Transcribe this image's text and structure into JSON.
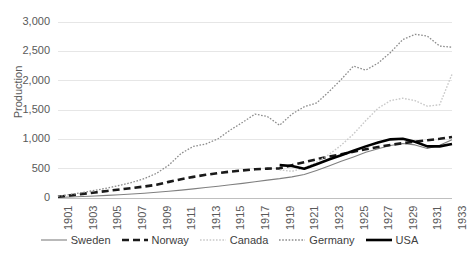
{
  "chart_data": {
    "type": "line",
    "title": "",
    "xlabel": "",
    "ylabel": "Production",
    "ylim": [
      0,
      3000
    ],
    "ytick_values": [
      0,
      500,
      1000,
      1500,
      2000,
      2500,
      3000
    ],
    "ytick_labels": [
      "0",
      "500",
      "1,000",
      "1,500",
      "2,000",
      "2,500",
      "3,000"
    ],
    "grid": true,
    "legend_position": "bottom",
    "x": [
      1901,
      1902,
      1903,
      1904,
      1905,
      1906,
      1907,
      1908,
      1909,
      1910,
      1911,
      1912,
      1913,
      1914,
      1915,
      1916,
      1917,
      1918,
      1919,
      1920,
      1921,
      1922,
      1923,
      1924,
      1925,
      1926,
      1927,
      1928,
      1929,
      1930,
      1931,
      1932,
      1933
    ],
    "xtick_labels": [
      "1901",
      "1903",
      "1905",
      "1907",
      "1909",
      "1911",
      "1913",
      "1915",
      "1917",
      "1919",
      "1921",
      "1923",
      "1925",
      "1927",
      "1929",
      "1931",
      "1933"
    ],
    "series": [
      {
        "name": "Sweden",
        "color": "#808080",
        "style": "solid",
        "width": 1.1,
        "values": [
          10,
          18,
          26,
          34,
          44,
          55,
          68,
          82,
          98,
          115,
          135,
          155,
          178,
          200,
          225,
          250,
          278,
          305,
          330,
          360,
          400,
          470,
          545,
          625,
          700,
          780,
          840,
          895,
          930,
          905,
          845,
          900,
          995
        ]
      },
      {
        "name": "Norway",
        "color": "#1a1a1a",
        "style": "dashed",
        "width": 2.6,
        "values": [
          20,
          45,
          70,
          95,
          120,
          145,
          170,
          195,
          225,
          275,
          320,
          360,
          395,
          425,
          450,
          470,
          490,
          500,
          505,
          560,
          610,
          660,
          705,
          745,
          790,
          830,
          870,
          905,
          935,
          960,
          985,
          1010,
          1040
        ]
      },
      {
        "name": "Canada",
        "color": "#c9c9c9",
        "style": "dotted",
        "width": 1.4,
        "values": [
          null,
          null,
          null,
          null,
          null,
          null,
          null,
          null,
          null,
          null,
          null,
          null,
          null,
          null,
          null,
          null,
          null,
          null,
          480,
          455,
          510,
          610,
          740,
          900,
          1090,
          1320,
          1530,
          1660,
          1700,
          1660,
          1565,
          1590,
          2110
        ]
      },
      {
        "name": "Germany",
        "color": "#8c8c8c",
        "style": "dotted",
        "width": 1.3,
        "values": [
          30,
          60,
          95,
          130,
          170,
          215,
          265,
          330,
          420,
          560,
          760,
          880,
          920,
          1010,
          1160,
          1290,
          1430,
          1390,
          1240,
          1430,
          1555,
          1620,
          1810,
          2020,
          2250,
          2180,
          2300,
          2480,
          2700,
          2790,
          2760,
          2590,
          2570
        ]
      },
      {
        "name": "USA",
        "color": "#000000",
        "style": "solid",
        "width": 2.6,
        "values": [
          null,
          null,
          null,
          null,
          null,
          null,
          null,
          null,
          null,
          null,
          null,
          null,
          null,
          null,
          null,
          null,
          null,
          null,
          560,
          545,
          500,
          575,
          655,
          730,
          805,
          880,
          945,
          1000,
          1010,
          960,
          880,
          880,
          920
        ]
      }
    ]
  },
  "legend": {
    "entries": [
      {
        "label": "Sweden"
      },
      {
        "label": "Norway"
      },
      {
        "label": "Canada"
      },
      {
        "label": "Germany"
      },
      {
        "label": "USA"
      }
    ]
  }
}
